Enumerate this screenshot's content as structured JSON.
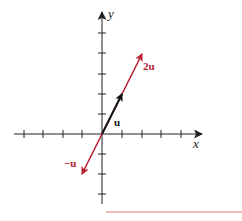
{
  "diagram": {
    "title": "",
    "axes": {
      "x_label": "x",
      "y_label": "y",
      "x_ticks": [
        -4,
        -3,
        -2,
        -1,
        1,
        2,
        3,
        4
      ],
      "y_ticks": [
        5,
        4,
        3,
        2,
        1,
        -1,
        -2,
        -3
      ]
    },
    "vectors": [
      {
        "name": "u",
        "label": "u",
        "from": [
          0,
          0
        ],
        "to": [
          1,
          2
        ],
        "color": "#111111"
      },
      {
        "name": "2u",
        "label": "2u",
        "from": [
          0,
          0
        ],
        "to": [
          2,
          4
        ],
        "color": "#b5212f"
      },
      {
        "name": "-u",
        "label": "−u",
        "from": [
          0,
          0
        ],
        "to": [
          -1,
          -2
        ],
        "color": "#b5212f"
      }
    ],
    "colors": {
      "axis": "#222222",
      "accent": "#b5212f",
      "rule": "#e0806a"
    }
  }
}
